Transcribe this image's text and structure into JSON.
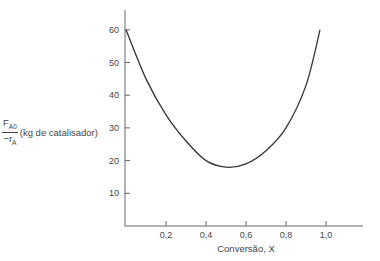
{
  "chart_data": {
    "type": "line",
    "title": "",
    "xlabel": "Conversão, X",
    "ylabel": {
      "numerator": "F",
      "numerator_sub": "A0",
      "denominator": "−r",
      "denominator_sub": "A",
      "unit": "(kg de catalisador)"
    },
    "xlim": [
      0,
      1.2
    ],
    "ylim": [
      0,
      65
    ],
    "x_ticks": [
      0.2,
      0.4,
      0.6,
      0.8,
      1.0
    ],
    "x_tick_labels": [
      "0,2",
      "0,4",
      "0,6",
      "0,8",
      "1,0"
    ],
    "y_ticks": [
      10,
      20,
      30,
      40,
      50,
      60
    ],
    "y_tick_labels": [
      "10",
      "20",
      "30",
      "40",
      "50",
      "60"
    ],
    "grid": false,
    "legend": null,
    "series": [
      {
        "name": "F_A0 / -r_A",
        "color": "#333333",
        "x": [
          0,
          0.1,
          0.2,
          0.3,
          0.4,
          0.5,
          0.6,
          0.7,
          0.8,
          0.9,
          0.97
        ],
        "y": [
          60,
          45,
          34,
          26,
          20,
          18,
          19,
          23,
          30,
          43,
          60
        ]
      }
    ]
  }
}
